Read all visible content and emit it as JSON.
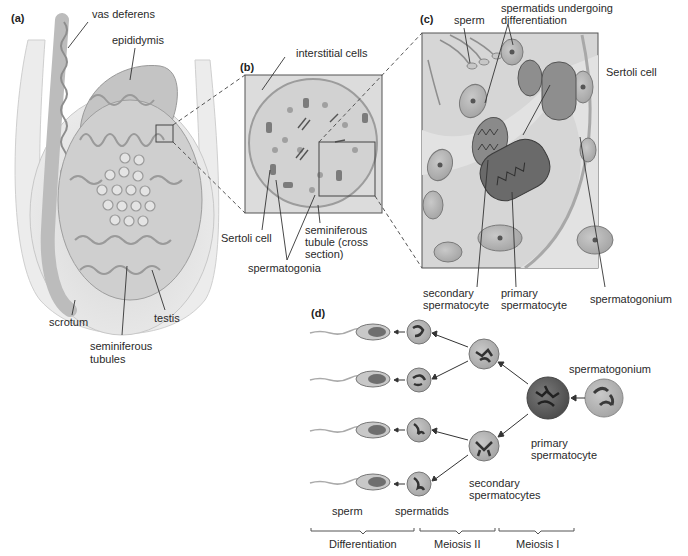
{
  "panels": {
    "a": {
      "tag": "(a)",
      "labels": {
        "vas_deferens": "vas deferens",
        "epididymis": "epididymis",
        "scrotum": "scrotum",
        "seminiferous_tubules_1": "seminiferous",
        "seminiferous_tubules_2": "tubules",
        "testis": "testis"
      }
    },
    "b": {
      "tag": "(b)",
      "labels": {
        "interstitial_cells": "interstitial cells",
        "sertoli_cell": "Sertoli cell",
        "spermatogonia": "spermatogonia",
        "seminiferous_tubule_1": "seminiferous",
        "seminiferous_tubule_2": "tubule (cross",
        "seminiferous_tubule_3": "section)"
      }
    },
    "c": {
      "tag": "(c)",
      "labels": {
        "sperm": "sperm",
        "spermatids_1": "spermatids undergoing",
        "spermatids_2": "differentiation",
        "sertoli_cell": "Sertoli cell",
        "secondary_1": "secondary",
        "secondary_2": "spermatocyte",
        "primary_1": "primary",
        "primary_2": "spermatocyte",
        "spermatogonium": "spermatogonium"
      }
    },
    "d": {
      "tag": "(d)",
      "labels": {
        "spermatogonium": "spermatogonium",
        "primary_1": "primary",
        "primary_2": "spermatocyte",
        "secondary_1": "secondary",
        "secondary_2": "spermatocytes",
        "sperm": "sperm",
        "spermatids": "spermatids"
      },
      "stages": [
        "Differentiation",
        "Meiosis II",
        "Meiosis I"
      ]
    }
  },
  "colors": {
    "background": "#ffffff",
    "tissue_light": "#d8d8d8",
    "tissue_mid": "#bdbdbd",
    "tissue_dark": "#8a8a8a",
    "cell_dark": "#5a5a5a",
    "line": "#333333"
  }
}
